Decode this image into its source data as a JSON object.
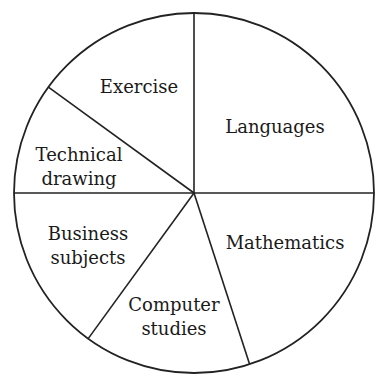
{
  "chart_data": {
    "type": "pie",
    "title": "",
    "start_angle_deg": 90,
    "direction": "clockwise",
    "center": [
      194,
      193
    ],
    "radius": 180,
    "colors": {
      "fill": "#ffffff",
      "stroke": "#222222",
      "text": "#1a1a1a"
    },
    "slices": [
      {
        "label": "Languages",
        "lines": [
          "Languages"
        ],
        "value": 25,
        "label_pos": [
          275,
          133
        ]
      },
      {
        "label": "Mathematics",
        "lines": [
          "Mathematics"
        ],
        "value": 20,
        "label_pos": [
          285,
          249
        ]
      },
      {
        "label": "Computer studies",
        "lines": [
          "Computer",
          "studies"
        ],
        "value": 15,
        "label_pos": [
          174,
          311
        ]
      },
      {
        "label": "Business subjects",
        "lines": [
          "Business",
          "subjects"
        ],
        "value": 15,
        "label_pos": [
          88,
          240
        ]
      },
      {
        "label": "Technical drawing",
        "lines": [
          "Technical",
          "drawing"
        ],
        "value": 10,
        "label_pos": [
          79,
          161
        ]
      },
      {
        "label": "Exercise",
        "lines": [
          "Exercise"
        ],
        "value": 15,
        "label_pos": [
          139,
          93
        ]
      }
    ],
    "legend": "none",
    "units": "percent"
  }
}
